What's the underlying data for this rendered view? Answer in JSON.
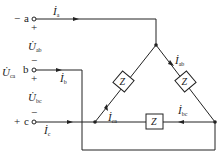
{
  "diagram": {
    "type": "three-phase delta-connected load circuit",
    "terminals": [
      {
        "name": "a",
        "left_sign": "−",
        "below_sign": "+"
      },
      {
        "name": "b",
        "above_sign": "−",
        "below_sign": "+"
      },
      {
        "name": "c",
        "left_sign": "+",
        "above_sign": "−"
      }
    ],
    "line_currents": [
      {
        "symbol": "İ",
        "sub": "a"
      },
      {
        "symbol": "İ",
        "sub": "b"
      },
      {
        "symbol": "İ",
        "sub": "c"
      }
    ],
    "voltages": [
      {
        "symbol": "U̇",
        "sub": "ab"
      },
      {
        "symbol": "U̇",
        "sub": "bc"
      },
      {
        "symbol": "U̇",
        "sub": "ca"
      }
    ],
    "phase_currents": [
      {
        "symbol": "İ",
        "sub": "ab"
      },
      {
        "symbol": "İ",
        "sub": "bc"
      },
      {
        "symbol": "İ",
        "sub": "ca"
      }
    ],
    "impedance_label": "Z",
    "colors": {
      "line": "#222222",
      "background": "#ffffff"
    }
  }
}
